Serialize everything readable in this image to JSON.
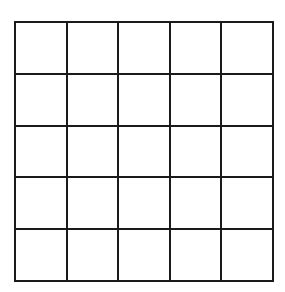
{
  "grid": {
    "rows": 5,
    "columns": 5,
    "line_color": "#1a1a1a",
    "background": "#ffffff"
  }
}
